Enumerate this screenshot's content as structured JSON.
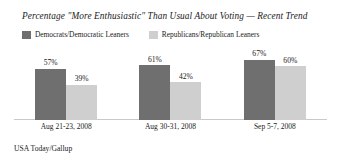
{
  "chart_data": {
    "type": "bar",
    "title": "Percentage \"More Enthusiastic\" Than Usual About Voting — Recent Trend",
    "xlabel": "",
    "ylabel": "",
    "ylim": [
      0,
      100
    ],
    "grid": false,
    "legend_position": "top-left",
    "categories": [
      "Aug 21-23, 2008",
      "Aug 30-31, 2008",
      "Sep 5-7, 2008"
    ],
    "series": [
      {
        "name": "Democrats/Democratic Leaners",
        "color": "#6f6f6f",
        "values": [
          57,
          61,
          67
        ],
        "value_labels": [
          "57%",
          "61%",
          "67%"
        ]
      },
      {
        "name": "Republicans/Republican Leaners",
        "color": "#cfcfcf",
        "values": [
          39,
          42,
          60
        ],
        "value_labels": [
          "39%",
          "42%",
          "60%"
        ]
      }
    ],
    "source": "USA Today/Gallup"
  },
  "legend": {
    "items": [
      {
        "label": "Democrats/Democratic Leaners",
        "color": "#6f6f6f"
      },
      {
        "label": "Republicans/Republican Leaners",
        "color": "#cfcfcf"
      }
    ]
  },
  "colors": {
    "democrat_bar": "#6f6f6f",
    "republican_bar": "#cfcfcf",
    "baseline": "#c9c9c9",
    "text": "#1a1a1a",
    "background": "#ffffff"
  }
}
